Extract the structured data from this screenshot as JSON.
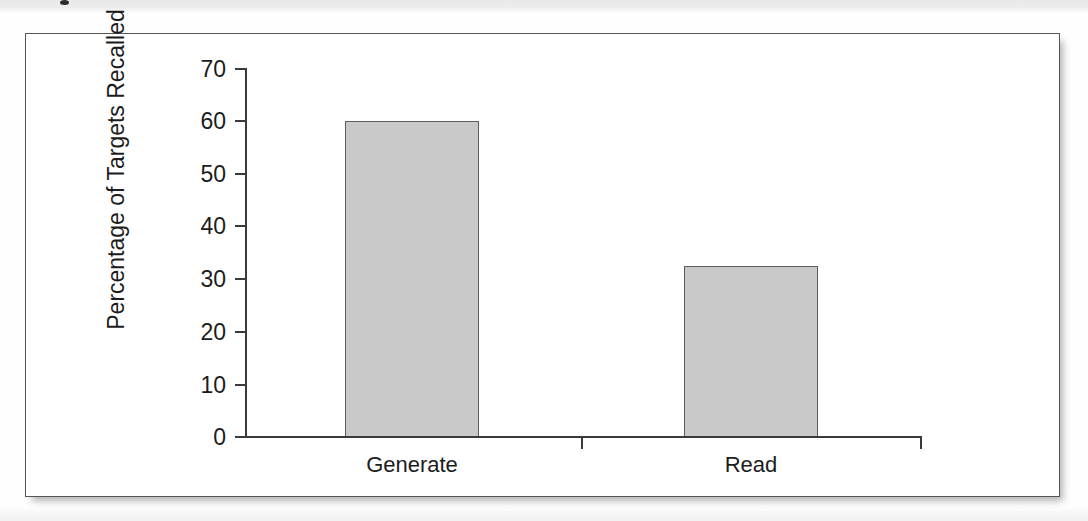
{
  "figure": {
    "background_color": "#ffffff",
    "frame_color": "#555555"
  },
  "chart_data": {
    "type": "bar",
    "title": "",
    "subtitle": "",
    "categories": [
      "Generate",
      "Read"
    ],
    "values": [
      60,
      32.5
    ],
    "series": [
      {
        "name": "Percentage of Targets Recalled",
        "values": [
          60,
          32.5
        ]
      }
    ],
    "xlabel": "",
    "ylabel": "Percentage of Targets Recalled",
    "ylim": [
      0,
      70
    ],
    "yticks": [
      0,
      10,
      20,
      30,
      40,
      50,
      60,
      70
    ],
    "ytick_labels": [
      "0",
      "10",
      "20",
      "30",
      "40",
      "50",
      "60",
      "70"
    ],
    "grid": false,
    "legend": false,
    "bar_fill_color": "#c9c9c9",
    "bar_edge_color": "#5d5d5d",
    "axis_color": "#3a3a3a",
    "annotations": []
  },
  "axes": {
    "y_title": "Percentage of Targets Recalled",
    "y_ticks": [
      {
        "label": "70",
        "value": 70
      },
      {
        "label": "60",
        "value": 60
      },
      {
        "label": "50",
        "value": 50
      },
      {
        "label": "40",
        "value": 40
      },
      {
        "label": "30",
        "value": 30
      },
      {
        "label": "20",
        "value": 20
      },
      {
        "label": "10",
        "value": 10
      },
      {
        "label": "0",
        "value": 0
      }
    ],
    "x_categories": [
      {
        "label": "Generate",
        "value": 60
      },
      {
        "label": "Read",
        "value": 32.5
      }
    ]
  }
}
